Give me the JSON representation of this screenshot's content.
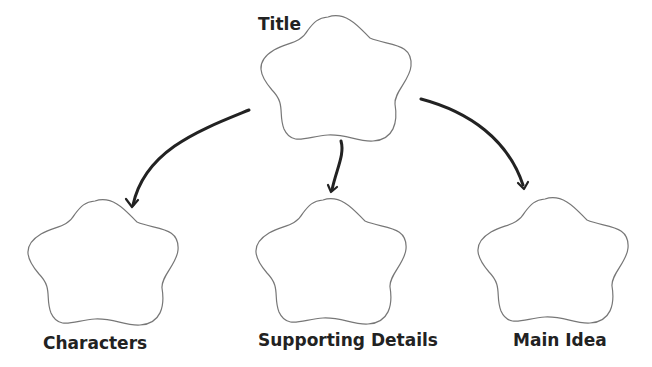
{
  "diagram": {
    "type": "graphic-organizer",
    "colors": {
      "shape_stroke": "#777777",
      "arrow": "#222222",
      "label": "#222222",
      "background": "#ffffff"
    },
    "nodes": [
      {
        "id": "title",
        "label": "Title",
        "shape": "flower-cloud"
      },
      {
        "id": "characters",
        "label": "Characters",
        "shape": "flower-cloud"
      },
      {
        "id": "supporting",
        "label": "Supporting Details",
        "shape": "flower-cloud"
      },
      {
        "id": "main",
        "label": "Main Idea",
        "shape": "flower-cloud"
      }
    ],
    "edges": [
      {
        "from": "title",
        "to": "characters"
      },
      {
        "from": "title",
        "to": "supporting"
      },
      {
        "from": "title",
        "to": "main"
      }
    ]
  }
}
